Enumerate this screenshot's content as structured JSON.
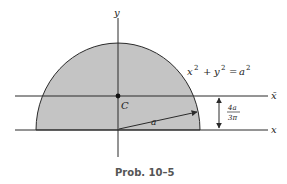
{
  "diagram": {
    "type": "semicircular area centroid figure",
    "shape_fill": "#c4c4c4",
    "line_color": "#2a2a2a",
    "axes": {
      "y_label": "y",
      "x_label": "x",
      "xbar_label": "x̄"
    },
    "equation": {
      "x": "x",
      "x_exp": "2",
      "plus": "+",
      "y": "y",
      "y_exp": "2",
      "eq": "=",
      "a": "a",
      "a_exp": "2"
    },
    "centroid_label": "C",
    "radius_label": "a",
    "dimension": {
      "numerator": "4a",
      "denominator": "3π"
    },
    "caption": "Prob. 10–5"
  }
}
